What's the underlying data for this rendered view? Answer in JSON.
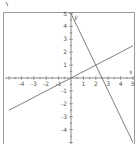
{
  "chart_data": {
    "type": "line",
    "title": "",
    "xlabel": "x",
    "ylabel": "y",
    "xlim": [
      -5,
      5
    ],
    "ylim": [
      -5,
      5
    ],
    "grid": false,
    "x_ticks": [
      -4,
      -3,
      -2,
      -1,
      1,
      2,
      3,
      4,
      5
    ],
    "y_ticks": [
      5,
      4,
      3,
      2,
      1,
      -1,
      -2,
      -3,
      -4
    ],
    "series": [
      {
        "name": "line-steep",
        "equation": "y = -2x + 5",
        "x": [
          0,
          5
        ],
        "y": [
          5,
          -5
        ]
      },
      {
        "name": "line-shallow",
        "equation": "y = 0.5x",
        "x": [
          -5,
          5
        ],
        "y": [
          -2.5,
          2.5
        ]
      }
    ],
    "annotations": [
      {
        "text": "intersection",
        "x": 2,
        "y": 1
      }
    ]
  },
  "colors": {
    "frame": "#9a9a9a",
    "axis": "#6a6a6a",
    "line": "#707070",
    "text": "#555555"
  }
}
